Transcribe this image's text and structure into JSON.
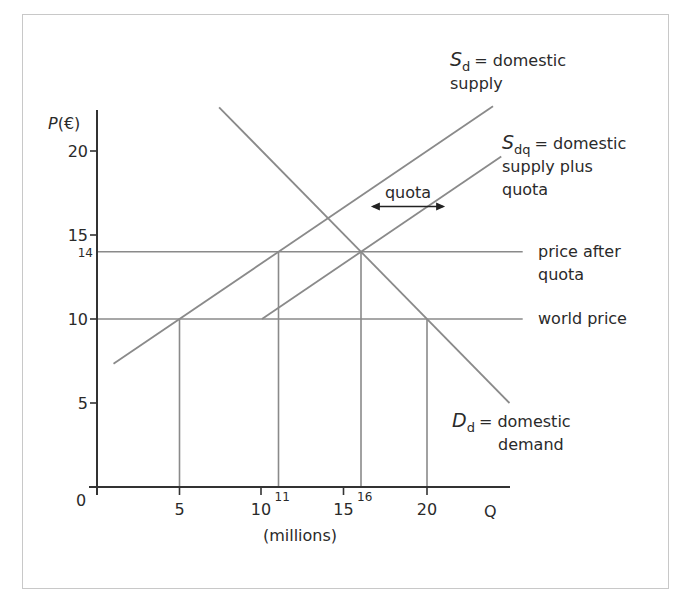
{
  "chart_data": {
    "type": "line",
    "title": "",
    "xlabel": "Q",
    "xlabel_units": "(millions)",
    "ylabel": "P(€)",
    "origin_label": "0",
    "xlim": [
      0,
      25
    ],
    "ylim": [
      0,
      22.5
    ],
    "x_ticks": [
      {
        "value": 5,
        "label": "5"
      },
      {
        "value": 10,
        "label": "10"
      },
      {
        "value": 15,
        "label": "15"
      },
      {
        "value": 20,
        "label": "20"
      }
    ],
    "x_minor_labels": [
      {
        "value": 11,
        "label": "11"
      },
      {
        "value": 16,
        "label": "16"
      }
    ],
    "y_ticks": [
      {
        "value": 5,
        "label": "5"
      },
      {
        "value": 10,
        "label": "10"
      },
      {
        "value": 15,
        "label": "15"
      },
      {
        "value": 20,
        "label": "20"
      }
    ],
    "y_minor_labels": [
      {
        "value": 14,
        "label": "14"
      }
    ],
    "grid": false,
    "series": [
      {
        "name": "S_d",
        "label_main": "S",
        "label_sub": "d",
        "label_text": "= domestic",
        "label_text2": "supply",
        "points": [
          [
            1,
            7.33
          ],
          [
            24,
            22.67
          ]
        ]
      },
      {
        "name": "S_dq",
        "label_main": "S",
        "label_sub": "dq",
        "label_text": "= domestic",
        "label_text2": "supply plus",
        "label_text3": "quota",
        "points": [
          [
            10,
            10
          ],
          [
            24.5,
            19.67
          ]
        ]
      },
      {
        "name": "D_d",
        "label_main": "D",
        "label_sub": "d",
        "label_text": "= domestic",
        "label_text2": "demand",
        "points": [
          [
            7.4,
            22.6
          ],
          [
            25,
            5
          ]
        ]
      }
    ],
    "horizontal_lines": [
      {
        "name": "price after quota",
        "label": "price after",
        "label2": "quota",
        "y": 14,
        "x_end": 25.8
      },
      {
        "name": "world price",
        "label": "world price",
        "y": 10,
        "x_end": 25.8
      }
    ],
    "vertical_drop_lines": [
      {
        "x": 5,
        "y": 10
      },
      {
        "x": 11,
        "y": 14
      },
      {
        "x": 16,
        "y": 14
      },
      {
        "x": 20,
        "y": 10
      }
    ],
    "annotations": [
      {
        "type": "double-arrow",
        "label": "quota",
        "from": [
          16.6,
          16.7
        ],
        "to": [
          21.1,
          16.7
        ]
      }
    ]
  }
}
